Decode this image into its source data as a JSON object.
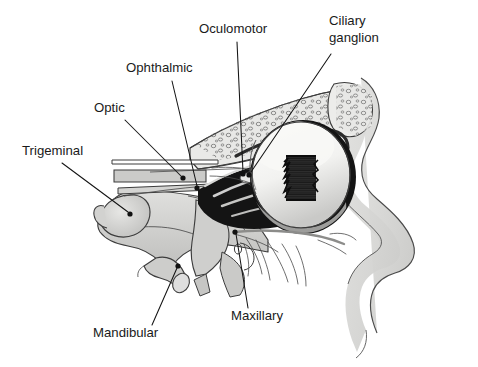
{
  "figure": {
    "background_color": "#ffffff",
    "width": 478,
    "height": 367
  },
  "palette": {
    "label_text": "#1a1a1a",
    "leader_line": "#141414",
    "bone_light": "#d8d8d6",
    "bone_mid": "#c3c3c1",
    "bone_dark": "#a8a8a6",
    "face_soft_tissue": "#dcdcda",
    "outline": "#3c3c3c",
    "shadow_black": "#111111",
    "eyeball_white": "#f6f6f4",
    "sclera_shade": "#cfcfcd"
  },
  "labels": [
    {
      "id": "oculomotor",
      "text": "Oculomotor",
      "text_x": 199,
      "text_y": 33,
      "lines": [
        "Oculomotor"
      ],
      "leader": {
        "x1": 237,
        "y1": 42,
        "x2": 243,
        "y2": 172
      },
      "dot": {
        "cx": 243,
        "cy": 174,
        "r": 2.6
      }
    },
    {
      "id": "ciliary-ganglion",
      "text": "Ciliary ganglion",
      "text_x": 329,
      "text_y": 25,
      "lines": [
        "Ciliary",
        "ganglion"
      ],
      "leader": {
        "x1": 331,
        "y1": 54,
        "x2": 251,
        "y2": 172
      },
      "dot": {
        "cx": 249,
        "cy": 175,
        "r": 2.6
      }
    },
    {
      "id": "ophthalmic",
      "text": "Ophthalmic",
      "text_x": 126,
      "text_y": 72,
      "lines": [
        "Ophthalmic"
      ],
      "leader": {
        "x1": 172,
        "y1": 81,
        "x2": 197,
        "y2": 186
      },
      "dot": {
        "cx": 197,
        "cy": 188,
        "r": 2.6
      }
    },
    {
      "id": "optic",
      "text": "Optic",
      "text_x": 94,
      "text_y": 112,
      "lines": [
        "Optic"
      ],
      "leader": {
        "x1": 125,
        "y1": 120,
        "x2": 181,
        "y2": 176
      },
      "dot": {
        "cx": 183,
        "cy": 178,
        "r": 2.6
      }
    },
    {
      "id": "trigeminal",
      "text": "Trigeminal",
      "text_x": 22,
      "text_y": 155,
      "lines": [
        "Trigeminal"
      ],
      "leader": {
        "x1": 62,
        "y1": 163,
        "x2": 128,
        "y2": 212
      },
      "dot": {
        "cx": 130,
        "cy": 214,
        "r": 2.6
      }
    },
    {
      "id": "mandibular",
      "text": "Mandibular",
      "text_x": 93,
      "text_y": 337,
      "lines": [
        "Mandibular"
      ],
      "leader": {
        "x1": 152,
        "y1": 325,
        "x2": 177,
        "y2": 268
      },
      "dot": {
        "cx": 178,
        "cy": 266,
        "r": 2.6
      }
    },
    {
      "id": "maxillary",
      "text": "Maxillary",
      "text_x": 231,
      "text_y": 320,
      "lines": [
        "Maxillary"
      ],
      "leader": {
        "x1": 248,
        "y1": 308,
        "x2": 236,
        "y2": 234
      },
      "dot": {
        "cx": 235,
        "cy": 232,
        "r": 2.6
      }
    }
  ],
  "structures": [
    {
      "id": "cranial-base",
      "name": "Cranial base and middle fossa bone"
    },
    {
      "id": "orbital-roof",
      "name": "Orbital roof with cancellous bone"
    },
    {
      "id": "frontal-sinus",
      "name": "Frontal region spongy bone texture"
    },
    {
      "id": "eyeball",
      "name": "Eyeball with iris and pupil"
    },
    {
      "id": "optic-canal",
      "name": "Optic nerve and canal bands"
    },
    {
      "id": "trigeminal-ganglion",
      "name": "Trigeminal ganglion"
    },
    {
      "id": "mandibular-trunk",
      "name": "Mandibular nerve trunk"
    },
    {
      "id": "maxillary-branches",
      "name": "Maxillary nerve branches"
    },
    {
      "id": "face-profile",
      "name": "Facial soft tissue profile with nose"
    },
    {
      "id": "orbital-contents",
      "name": "Orbital fat and extraocular muscles"
    }
  ]
}
